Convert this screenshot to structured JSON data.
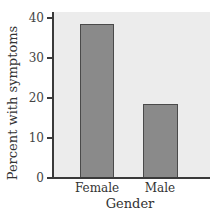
{
  "chart_data": {
    "type": "bar",
    "title": "",
    "categories": [
      "Female",
      "Male"
    ],
    "values": [
      38.5,
      18.5
    ],
    "xlabel": "Gender",
    "ylabel": "Percent with symptoms",
    "ylim": [
      0,
      40
    ],
    "yticks": [
      0,
      10,
      20,
      30,
      40
    ],
    "grid": false,
    "legend": null,
    "bar_color": "#8a8a8a",
    "background_color": "#ececec"
  },
  "axis": {
    "ylabel": "Percent with symptoms",
    "xlabel": "Gender",
    "yticks": [
      "0",
      "10",
      "20",
      "30",
      "40"
    ]
  },
  "categories": [
    "Female",
    "Male"
  ]
}
